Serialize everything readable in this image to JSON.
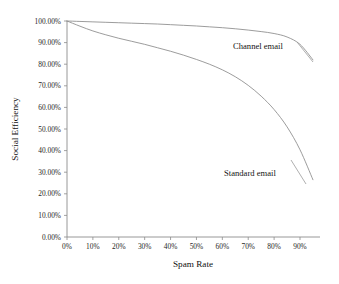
{
  "chart_data": {
    "type": "line",
    "title": "",
    "xlabel": "Spam Rate",
    "ylabel": "Social Efficiency",
    "xlim": [
      0,
      95
    ],
    "ylim": [
      0,
      100
    ],
    "grid": false,
    "legend_position": "inline-annotation",
    "xtick_labels": [
      "0%",
      "10%",
      "20%",
      "30%",
      "40%",
      "50%",
      "60%",
      "70%",
      "80%",
      "90%"
    ],
    "xtick_values": [
      0,
      10,
      20,
      30,
      40,
      50,
      60,
      70,
      80,
      90
    ],
    "ytick_labels": [
      "0.00%",
      "10.00%",
      "20.00%",
      "30.00%",
      "40.00%",
      "50.00%",
      "60.00%",
      "70.00%",
      "80.00%",
      "90.00%",
      "100.00%"
    ],
    "ytick_values": [
      0,
      10,
      20,
      30,
      40,
      50,
      60,
      70,
      80,
      90,
      100
    ],
    "x": [
      0,
      5,
      10,
      15,
      20,
      25,
      30,
      35,
      40,
      45,
      50,
      55,
      60,
      65,
      70,
      75,
      80,
      85,
      90,
      95
    ],
    "series": [
      {
        "name": "Channel email",
        "color": "#8a8a8a",
        "values": [
          100,
          99.8,
          99.6,
          99.4,
          99.2,
          99.0,
          98.8,
          98.6,
          98.3,
          98.0,
          97.7,
          97.3,
          96.9,
          96.4,
          95.8,
          95.1,
          94.2,
          92.6,
          89.2,
          82.0
        ]
      },
      {
        "name": "Standard email",
        "color": "#8a8a8a",
        "values": [
          100,
          97.6,
          95.4,
          93.6,
          92.0,
          90.6,
          89.2,
          87.6,
          86.0,
          84.2,
          82.2,
          80.0,
          77.4,
          74.2,
          70.2,
          65.2,
          59.0,
          51.0,
          40.4,
          26.5
        ]
      }
    ],
    "annotations": [
      {
        "text": "Channel email",
        "x": 70,
        "y": 86
      },
      {
        "text": "Standard email",
        "x": 66,
        "y": 32
      }
    ]
  }
}
